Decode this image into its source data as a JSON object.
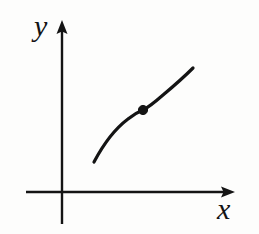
{
  "figure": {
    "title": "",
    "background_color": "#fdfdfc",
    "ink_color": "#141414"
  },
  "axes": {
    "x_label": "x",
    "y_label": "y",
    "origin": {
      "x": 62,
      "y": 192
    },
    "x_axis": {
      "start_x": 26,
      "end_x": 235,
      "y": 192,
      "arrow": "right",
      "stroke_width": 2.4
    },
    "y_axis": {
      "x": 62,
      "start_y": 224,
      "end_y": 20,
      "arrow": "up",
      "stroke_width": 2.4
    },
    "ticks": [],
    "tick_labels": [],
    "grid": false
  },
  "chart_data": {
    "type": "line",
    "title": "",
    "xlabel": "x",
    "ylabel": "y",
    "grid": false,
    "legend": null,
    "axis_origin_px": {
      "x": 62,
      "y": 192
    },
    "xlim_px": [
      26,
      235
    ],
    "ylim_px": [
      224,
      20
    ],
    "series": [
      {
        "name": "curve",
        "description": "S-shaped (sigmoid / cubic-like) increasing curve with one inflection point",
        "color": "#141414",
        "stroke_width": 3.2,
        "points_px": [
          {
            "x": 94,
            "y": 162
          },
          {
            "x": 99,
            "y": 153
          },
          {
            "x": 105,
            "y": 144
          },
          {
            "x": 112,
            "y": 135
          },
          {
            "x": 120,
            "y": 127
          },
          {
            "x": 129,
            "y": 119
          },
          {
            "x": 136,
            "y": 114
          },
          {
            "x": 143,
            "y": 110
          },
          {
            "x": 150,
            "y": 106
          },
          {
            "x": 158,
            "y": 101
          },
          {
            "x": 166,
            "y": 94
          },
          {
            "x": 174,
            "y": 87
          },
          {
            "x": 181,
            "y": 80
          },
          {
            "x": 188,
            "y": 73
          },
          {
            "x": 193,
            "y": 68
          }
        ],
        "path_d": "M 94 162 C 103 145 116 128 128 119 C 134 114 138 112 143 110 C 149 107 155 102 163 95 C 175 85 187 74 193 68"
      }
    ],
    "annotations": [
      {
        "kind": "point-marker",
        "name": "inflection-point",
        "label": "",
        "x_px": 143,
        "y_px": 110,
        "radius_px": 4.6,
        "filled": true,
        "color": "#141414"
      }
    ]
  }
}
